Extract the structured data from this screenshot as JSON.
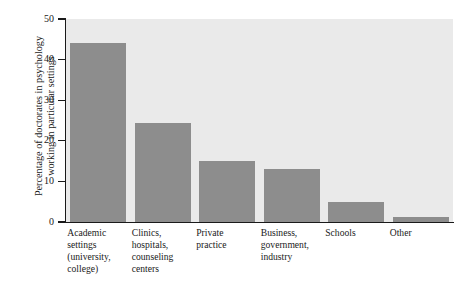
{
  "chart_data": {
    "type": "bar",
    "title": "",
    "xlabel": "",
    "ylabel": "Percentage of doctorates in psychology working in particular settings",
    "ylabel_lines": [
      "Percentage of doctorates in psychology",
      "working in particular settings"
    ],
    "categories": [
      "Academic settings (university, college)",
      "Clinics, hospitals, counseling centers",
      "Private practice",
      "Business, government, industry",
      "Schools",
      "Other"
    ],
    "category_lines": [
      [
        "Academic",
        "settings",
        "(university,",
        "college)"
      ],
      [
        "Clinics,",
        "hospitals,",
        "counseling",
        "centers"
      ],
      [
        "Private",
        "practice"
      ],
      [
        "Business,",
        "government,",
        "industry"
      ],
      [
        "Schools"
      ],
      [
        "Other"
      ]
    ],
    "values": [
      44,
      24.4,
      15,
      13,
      5,
      1.2
    ],
    "ylim": [
      0,
      50
    ],
    "yticks": [
      0,
      10,
      20,
      30,
      40,
      50
    ],
    "ytick_labels": [
      "0",
      "10",
      "20",
      "30",
      "40",
      "50"
    ],
    "grid": false,
    "legend": null,
    "colors": {
      "bar": "#8d8d8d",
      "plot_background": "#eaeaea",
      "figure_background": "#ffffff",
      "axis": "#1a1a1a",
      "text": "#1a1a1a"
    }
  }
}
